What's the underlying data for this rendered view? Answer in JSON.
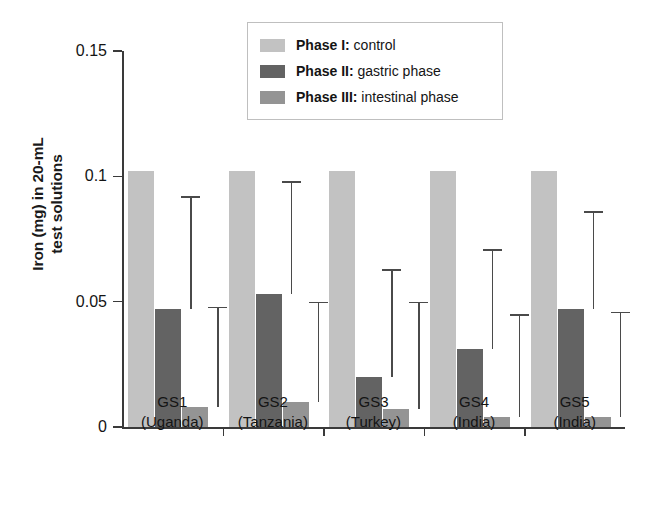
{
  "chart_data": {
    "type": "bar",
    "title": "",
    "xlabel": "",
    "ylabel": "Iron (mg) in 20-mL test solutions",
    "ylabel_lines": [
      "Iron (mg) in 20-mL",
      "test solutions"
    ],
    "ylim": [
      0,
      0.15
    ],
    "yticks": [
      "0",
      "0.05",
      "0.1",
      "0.15"
    ],
    "ytick_values": [
      0,
      0.05,
      0.1,
      0.15
    ],
    "grid": false,
    "legend_position": "top-center",
    "categories": [
      "GS1",
      "GS2",
      "GS3",
      "GS4",
      "GS5"
    ],
    "category_sublabels": [
      "(Uganda)",
      "(Tanzania)",
      "(Turkey)",
      "(India)",
      "(India)"
    ],
    "series": [
      {
        "name": "Phase I: control",
        "color": "#c2c2c2",
        "values": [
          0.102,
          0.102,
          0.102,
          0.102,
          0.102
        ],
        "errors_upper": [
          null,
          null,
          null,
          null,
          null
        ]
      },
      {
        "name": "Phase II: gastric phase",
        "color": "#636363",
        "values": [
          0.047,
          0.053,
          0.02,
          0.031,
          0.047
        ],
        "errors_upper": [
          0.092,
          0.098,
          0.063,
          0.071,
          0.086
        ]
      },
      {
        "name": "Phase III: intestinal phase",
        "color": "#949494",
        "values": [
          0.008,
          0.01,
          0.007,
          0.004,
          0.004
        ],
        "errors_upper": [
          0.048,
          0.05,
          0.05,
          0.045,
          0.046
        ]
      }
    ]
  },
  "legend": {
    "items": [
      {
        "bold": "Phase I:",
        "rest": " control",
        "color": "#c2c2c2"
      },
      {
        "bold": "Phase II:",
        "rest": " gastric phase",
        "color": "#636363"
      },
      {
        "bold": "Phase III:",
        "rest": " intestinal phase",
        "color": "#949494"
      }
    ]
  }
}
